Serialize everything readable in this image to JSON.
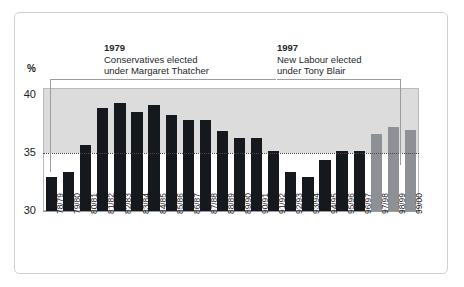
{
  "figure": {
    "background": "#ffffff",
    "frame_color": "#cfd2d4",
    "band_color": "#dcdcdc",
    "bar_color_dark": "#15181c",
    "bar_color_grey": "#8d9094"
  },
  "axis": {
    "y_unit_label": "%",
    "y_ticks": [
      "30",
      "35",
      "40"
    ],
    "y_min": 30,
    "y_max": 40.6
  },
  "annotations": [
    {
      "year": "1979",
      "line1": "Conservatives elected",
      "line2": "under Margaret Thatcher",
      "points_to": "78/79"
    },
    {
      "year": "1997",
      "line1": "New Labour elected",
      "line2": "under Tony Blair",
      "points_to": "97/98"
    }
  ],
  "chart_data": {
    "type": "bar",
    "title": "",
    "xlabel": "",
    "ylabel": "%",
    "ylim": [
      30,
      40.6
    ],
    "grid": true,
    "gridlines": [
      35
    ],
    "legend": "none",
    "categories": [
      "78/79",
      "79/80",
      "80/81",
      "81/82",
      "82/83",
      "83/84",
      "84/85",
      "85/86",
      "86/87",
      "87/88",
      "88/89",
      "89/90",
      "90/91",
      "91/92",
      "92/93",
      "93/94",
      "94/95",
      "95/96",
      "96/97",
      "97/98",
      "98/99",
      "99/00"
    ],
    "values": [
      32.9,
      33.4,
      35.7,
      38.9,
      39.3,
      38.5,
      39.1,
      38.3,
      37.8,
      37.8,
      36.9,
      36.3,
      36.3,
      35.2,
      33.4,
      32.9,
      34.4,
      35.2,
      35.2,
      36.6,
      37.2,
      37.0
    ],
    "bar_styles": [
      "dark",
      "dark",
      "dark",
      "dark",
      "dark",
      "dark",
      "dark",
      "dark",
      "dark",
      "dark",
      "dark",
      "dark",
      "dark",
      "dark",
      "dark",
      "dark",
      "dark",
      "dark",
      "dark",
      "grey",
      "grey",
      "grey"
    ]
  }
}
